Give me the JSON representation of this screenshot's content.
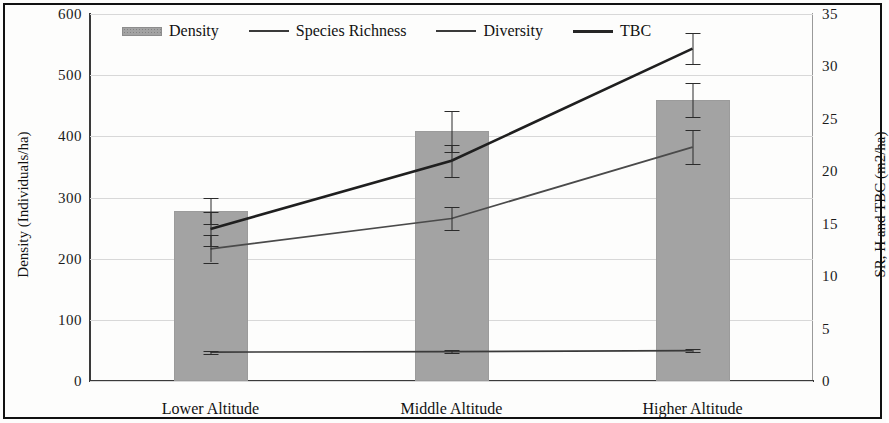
{
  "legend": {
    "position": "top-inside",
    "items": [
      {
        "label": "Density",
        "marker": "bar-swatch-icon"
      },
      {
        "label": "Species Richness",
        "marker": "line-swatch-icon"
      },
      {
        "label": "Diversity",
        "marker": "line-swatch-icon"
      },
      {
        "label": "TBC",
        "marker": "line-swatch-icon"
      }
    ]
  },
  "axes": {
    "left_title": "Density (Individuals/ha)",
    "right_title": "SR, H and TBC (m2/ha)",
    "left_ticks": [
      "0",
      "100",
      "200",
      "300",
      "400",
      "500",
      "600"
    ],
    "right_ticks": [
      "0",
      "5",
      "10",
      "15",
      "20",
      "25",
      "30",
      "35"
    ]
  },
  "chart_data": {
    "type": "bar",
    "title": "",
    "subtitle": "",
    "xlabel": "",
    "ylabel": "Density (Individuals/ha)",
    "y2label": "SR, H and TBC (m2/ha)",
    "categories": [
      "Lower Altitude",
      "Middle Altitude",
      "Higher Altitude"
    ],
    "ylim": [
      0,
      600
    ],
    "y2lim": [
      0,
      35
    ],
    "ytick_step": 100,
    "y2tick_step": 5,
    "grid": true,
    "grid_axis": "y",
    "legend_position": "top-inside",
    "series": [
      {
        "name": "Density",
        "kind": "bar",
        "axis": "left",
        "unit": "Individuals/ha",
        "values": [
          278,
          408,
          460
        ],
        "errors": [
          22,
          33,
          28
        ],
        "color": "#a3a3a3"
      },
      {
        "name": "Species Richness",
        "kind": "line",
        "axis": "right",
        "unit": "m2/ha",
        "values": [
          12.6,
          15.5,
          22.3
        ],
        "errors": [
          1.3,
          1.1,
          1.6
        ],
        "color": "#4a4a4a"
      },
      {
        "name": "Diversity",
        "kind": "line",
        "axis": "right",
        "unit": "m2/ha",
        "values": [
          2.75,
          2.8,
          2.9
        ],
        "errors": [
          0.15,
          0.15,
          0.15
        ],
        "color": "#3a3a3a"
      },
      {
        "name": "TBC",
        "kind": "line",
        "axis": "right",
        "unit": "m2/ha",
        "values": [
          14.5,
          21.0,
          31.7
        ],
        "errors": [
          1.6,
          1.5,
          1.5
        ],
        "color": "#1f1f1f"
      }
    ]
  }
}
